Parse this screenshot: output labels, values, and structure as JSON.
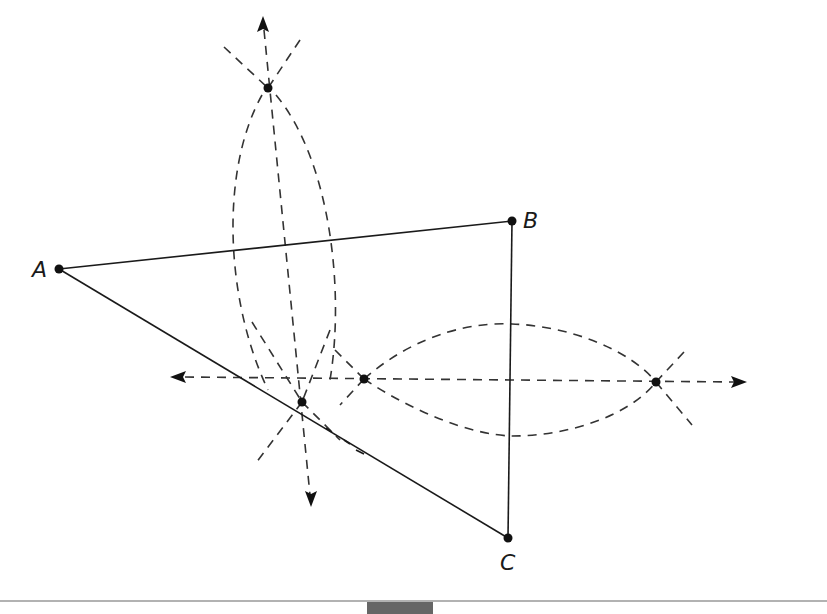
{
  "figure": {
    "colors": {
      "ink": "#1a1a1a",
      "dash": "#333333",
      "background": "#ffffff",
      "bottom_rule": "#999999",
      "bottom_block": "#666666"
    },
    "vertices": [
      {
        "name": "A",
        "label": "A",
        "x": 59,
        "y": 269
      },
      {
        "name": "B",
        "label": "B",
        "x": 512,
        "y": 221
      },
      {
        "name": "C",
        "label": "C",
        "x": 508,
        "y": 538
      }
    ],
    "sides": [
      {
        "from": "A",
        "to": "B"
      },
      {
        "from": "B",
        "to": "C"
      },
      {
        "from": "A",
        "to": "C"
      }
    ],
    "construction_points": [
      {
        "name": "arc-intersection-top",
        "x": 268,
        "y": 88
      },
      {
        "name": "arc-intersection-bottom",
        "x": 302,
        "y": 402
      },
      {
        "name": "arc-intersection-left",
        "x": 364,
        "y": 379
      },
      {
        "name": "arc-intersection-right",
        "x": 656,
        "y": 382
      }
    ],
    "bisector_lines": [
      {
        "name": "perpendicular-bisector-AB",
        "x1": 263,
        "y1": 22,
        "x2": 311,
        "y2": 500
      },
      {
        "name": "perpendicular-bisector-BC",
        "x1": 178,
        "y1": 377,
        "x2": 740,
        "y2": 382
      }
    ]
  }
}
